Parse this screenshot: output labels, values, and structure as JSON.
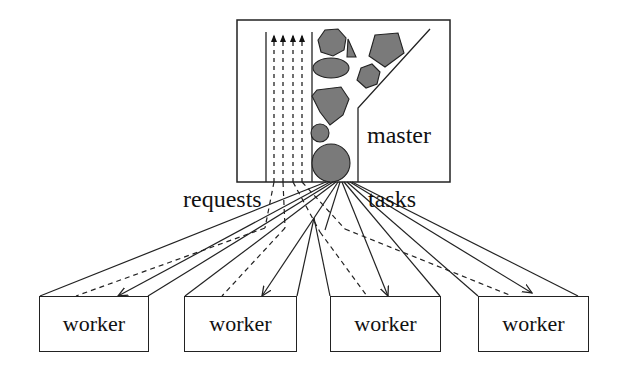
{
  "diagram": {
    "master_label": "master",
    "requests_label": "requests",
    "tasks_label": "tasks",
    "workers": [
      {
        "label": "worker"
      },
      {
        "label": "worker"
      },
      {
        "label": "worker"
      },
      {
        "label": "worker"
      }
    ],
    "colors": {
      "line": "#222222",
      "shape_fill": "#7a7a7a",
      "background": "#ffffff"
    }
  }
}
